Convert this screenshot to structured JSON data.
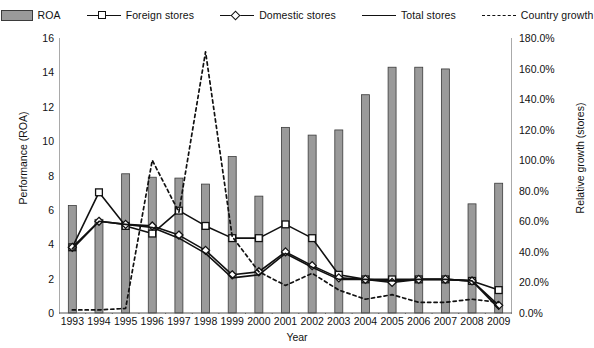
{
  "chart_data": {
    "type": "bar",
    "title": "",
    "xlabel": "Year",
    "ylabel": "Performance (ROA)",
    "y2label": "Relative growth (stores)",
    "categories": [
      "1993",
      "1994",
      "1995",
      "1996",
      "1997",
      "1998",
      "1999",
      "2000",
      "2001",
      "2002",
      "2003",
      "2004",
      "2005",
      "2006",
      "2007",
      "2008",
      "2009"
    ],
    "ylim": [
      0,
      16
    ],
    "yticks": [
      "0",
      "2",
      "4",
      "6",
      "8",
      "10",
      "12",
      "14",
      "16"
    ],
    "y2lim": [
      0,
      180
    ],
    "y2ticks": [
      "0.0%",
      "20.0%",
      "40.0%",
      "60.0%",
      "80.0%",
      "100.0%",
      "120.0%",
      "140.0%",
      "160.0%",
      "180.0%"
    ],
    "grid": false,
    "legend_position": "top",
    "series": [
      {
        "name": "ROA",
        "type": "bar",
        "axis": "left",
        "color": "#9a9a9a",
        "edge_color": "#3b3b3b",
        "values": [
          6.25,
          5.45,
          8.1,
          7.9,
          7.85,
          7.5,
          9.1,
          6.8,
          10.8,
          10.35,
          10.65,
          12.7,
          14.3,
          14.3,
          14.2,
          6.35,
          7.55
        ]
      },
      {
        "name": "Foreign stores",
        "type": "line",
        "axis": "right",
        "marker": "square",
        "color": "#111111",
        "values": [
          43.0,
          79.0,
          57.0,
          52.0,
          67.0,
          57.0,
          49.0,
          49.0,
          58.0,
          49.0,
          25.0,
          22.0,
          22.0,
          22.0,
          22.0,
          21.0,
          15.0
        ]
      },
      {
        "name": "Domestic stores",
        "type": "line",
        "axis": "right",
        "marker": "diamond",
        "color": "#111111",
        "values": [
          43.0,
          60.0,
          58.0,
          57.0,
          51.0,
          41.0,
          25.0,
          27.0,
          40.0,
          31.0,
          23.0,
          22.0,
          20.0,
          22.0,
          22.0,
          21.0,
          5.0
        ]
      },
      {
        "name": "Total stores",
        "type": "line",
        "axis": "right",
        "marker": "none",
        "color": "#111111",
        "values": [
          42.0,
          60.0,
          58.0,
          56.0,
          49.0,
          39.0,
          23.0,
          25.0,
          39.0,
          30.0,
          22.0,
          22.0,
          21.0,
          22.0,
          22.0,
          21.0,
          3.0
        ]
      },
      {
        "name": "Country growth",
        "type": "line",
        "axis": "right",
        "marker": "none",
        "style": "dashed",
        "color": "#111111",
        "values": [
          2.0,
          2.0,
          3.0,
          100.0,
          66.0,
          171.0,
          50.0,
          27.0,
          18.0,
          26.0,
          15.0,
          9.0,
          12.0,
          7.0,
          7.0,
          9.0,
          7.0
        ]
      }
    ]
  },
  "legend": {
    "items": [
      {
        "label": "ROA",
        "icon": "filled-bar-swatch"
      },
      {
        "label": "Foreign stores",
        "icon": "line-square-marker"
      },
      {
        "label": "Domestic stores",
        "icon": "line-diamond-marker"
      },
      {
        "label": "Total stores",
        "icon": "solid-line"
      },
      {
        "label": "Country growth",
        "icon": "dashed-line"
      }
    ]
  }
}
